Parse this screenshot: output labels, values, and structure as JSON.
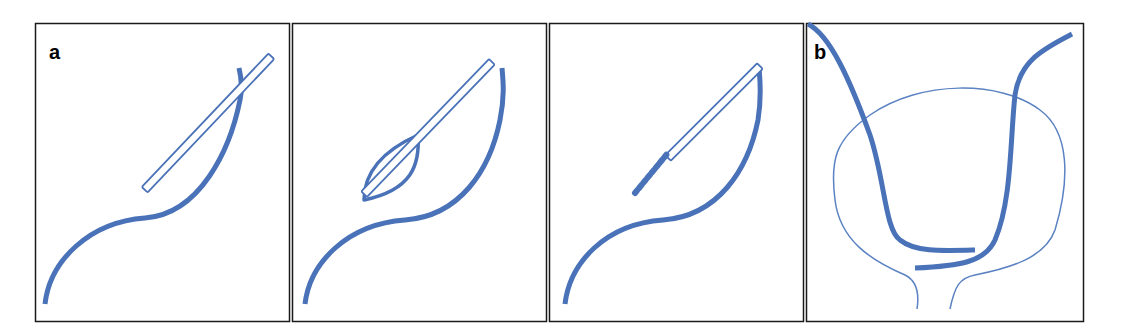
{
  "figure": {
    "panels": [
      {
        "id": "panel-1",
        "label": "a",
        "description": "Guide rod alongside curved ureter"
      },
      {
        "id": "panel-2",
        "label": "",
        "description": "Balloon dilation around rod"
      },
      {
        "id": "panel-3",
        "label": "",
        "description": "Stent/coil at rod tip"
      },
      {
        "id": "panel-4",
        "label": "b",
        "description": "Bladder outline with two ureteral stents"
      }
    ],
    "colors": {
      "stroke_blue": "#4a72b8",
      "thin_blue": "#5b82c2",
      "border": "#1a1a1a",
      "background": "#ffffff"
    }
  }
}
